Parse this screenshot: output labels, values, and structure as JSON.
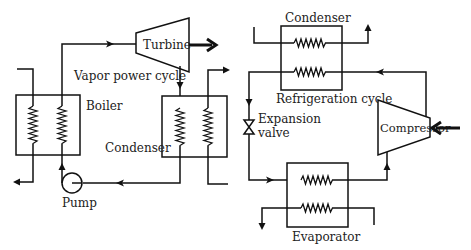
{
  "diagram": {
    "vapor_power_cycle": {
      "title": "Vapor power cycle",
      "components": {
        "turbine": "Turbine",
        "boiler": "Boiler",
        "condenser": "Condenser",
        "pump": "Pump"
      }
    },
    "refrigeration_cycle": {
      "title": "Refrigeration cycle",
      "components": {
        "condenser": "Condenser",
        "expansion_valve_line1": "Expansion",
        "expansion_valve_line2": "valve",
        "compressor": "Compressor",
        "evaporator": "Evaporator"
      }
    }
  }
}
